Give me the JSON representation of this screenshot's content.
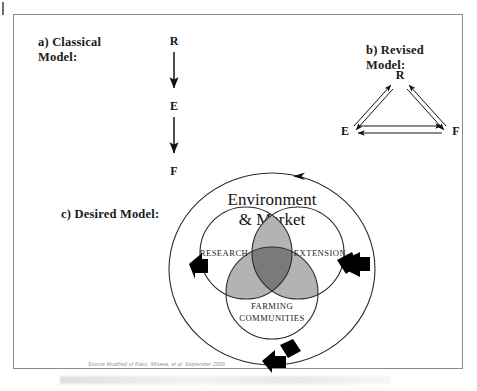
{
  "figure": {
    "panels": [
      {
        "id": "classical",
        "title": "a) Classical\nModel:",
        "title_line1": "a) Classical",
        "title_line2": "Model:",
        "type": "linear-chain",
        "nodes": [
          "R",
          "E",
          "F"
        ],
        "arrows": [
          {
            "from": "R",
            "to": "E",
            "direction": "down",
            "style": "single-head"
          },
          {
            "from": "E",
            "to": "F",
            "direction": "down",
            "style": "single-head"
          }
        ]
      },
      {
        "id": "revised",
        "title": "b) Revised Model:",
        "type": "triangle-network",
        "nodes": [
          "R",
          "E",
          "F"
        ],
        "arrows": [
          {
            "from": "E",
            "to": "R",
            "style": "double-line-bidirectional"
          },
          {
            "from": "R",
            "to": "F",
            "style": "double-line-bidirectional"
          },
          {
            "from": "E",
            "to": "F",
            "style": "double-line-bidirectional"
          }
        ]
      },
      {
        "id": "desired",
        "title": "c) Desired Model:",
        "type": "venn-in-cycle",
        "outer_label_line1": "Environment",
        "outer_label_line2": "& Market",
        "circles": [
          {
            "label": "RESEARCH"
          },
          {
            "label": "EXTENSION"
          },
          {
            "label_line1": "FARMING",
            "label_line2": "COMMUNITIES"
          }
        ],
        "cycle_arrows": 4,
        "cycle_direction": "counter-clockwise"
      }
    ],
    "source_note": "Source Modified of  Kiaro, Mtseea, et.al.   September 2000",
    "colors": {
      "ink": "#1a1a1a",
      "frame": "#8a8a8a",
      "pair_overlap": "#b3b3b3",
      "triple_overlap": "#7a7a7a",
      "circle_stroke": "#2b2b2b",
      "arrow_black": "#000000",
      "source_text": "#8d8d8d"
    }
  }
}
